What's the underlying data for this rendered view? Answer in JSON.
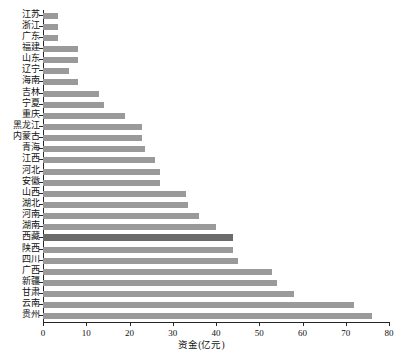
{
  "chart_data": {
    "type": "bar",
    "orientation": "horizontal",
    "title": "",
    "xlabel": "资金(亿元)",
    "ylabel": "",
    "xlim": [
      0,
      80
    ],
    "xticks": [
      0,
      10,
      20,
      30,
      40,
      50,
      60,
      70,
      80
    ],
    "grid": false,
    "legend": null,
    "bar_color": "#9a9a9a",
    "highlight_color": "#6b6b6b",
    "highlight_category": "西藏",
    "categories": [
      "江苏",
      "浙江",
      "广东",
      "福建",
      "山东",
      "辽宁",
      "海南",
      "吉林",
      "宁夏",
      "重庆",
      "黑龙江",
      "内蒙古",
      "青海",
      "江西",
      "河北",
      "安徽",
      "山西",
      "湖北",
      "河南",
      "湖南",
      "西藏",
      "陕西",
      "四川",
      "广西",
      "新疆",
      "甘肃",
      "云南",
      "贵州"
    ],
    "values": [
      3.5,
      3.5,
      3.5,
      8.0,
      8.0,
      6.0,
      8.0,
      13.0,
      14.0,
      19.0,
      23.0,
      23.0,
      23.5,
      26.0,
      27.0,
      27.0,
      33.0,
      33.5,
      36.0,
      40.0,
      44.0,
      44.0,
      45.0,
      53.0,
      54.0,
      58.0,
      72.0,
      76.0
    ]
  }
}
